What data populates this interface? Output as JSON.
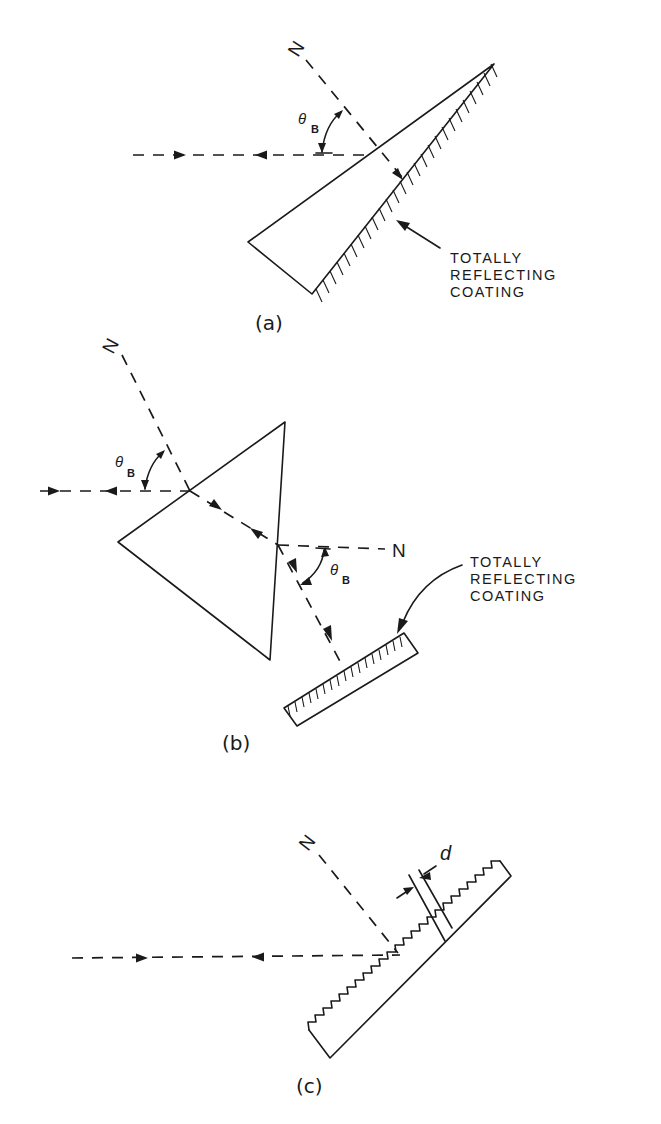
{
  "figure": {
    "panels": [
      {
        "id": "a",
        "caption": "(a)",
        "normal_label": "N",
        "angle_label": "θ",
        "angle_subscript": "B",
        "component": "wedge prism with totally reflecting coating",
        "note_lines": [
          "TOTALLY",
          "REFLECTING",
          "COATING"
        ]
      },
      {
        "id": "b",
        "caption": "(b)",
        "normal_label_1": "N",
        "normal_label_2": "N",
        "angle_label_1": "θ",
        "angle_subscript_1": "B",
        "angle_label_2": "θ",
        "angle_subscript_2": "B",
        "component": "triangular prism with separate mirror",
        "note_lines": [
          "TOTALLY",
          "REFLECTING",
          "COATING"
        ]
      },
      {
        "id": "c",
        "caption": "(c)",
        "normal_label": "N",
        "spacing_label": "d",
        "component": "diffraction grating (echelette)"
      }
    ]
  }
}
